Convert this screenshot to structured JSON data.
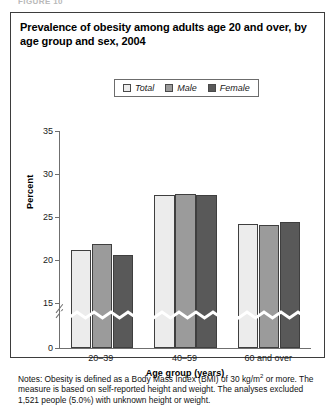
{
  "figure_caption": "FIGURE 10",
  "title": "Prevalence of obesity among adults age 20 and over, by age group and sex, 2004",
  "legend": {
    "items": [
      {
        "label": "Total",
        "color": "#ececec"
      },
      {
        "label": "Male",
        "color": "#9b9b9b"
      },
      {
        "label": "Female",
        "color": "#595959"
      }
    ]
  },
  "notes": {
    "prefix": "Notes: Obesity is defined as a Body Mass Index (BMI) of 30 kg/m",
    "superscript": "2",
    "suffix": " or more. The measure is based on self-reported height and weight. The analyses excluded 1,521 people (5.0%) with unknown height or weight."
  },
  "chart_data": {
    "type": "bar",
    "title": "Prevalence of obesity among adults age 20 and over, by age group and sex, 2004",
    "xlabel": "Age group (years)",
    "ylabel": "Percent",
    "categories": [
      "20–39",
      "40–59",
      "60 and over"
    ],
    "series": [
      {
        "name": "Total",
        "color": "#ececec",
        "values": [
          21.1,
          27.5,
          24.1
        ]
      },
      {
        "name": "Male",
        "color": "#9b9b9b",
        "values": [
          21.7,
          27.6,
          23.9
        ]
      },
      {
        "name": "Female",
        "color": "#595959",
        "values": [
          20.5,
          27.4,
          24.3
        ]
      }
    ],
    "ylim": [
      0,
      35
    ],
    "yticks": [
      0,
      15,
      20,
      25,
      30,
      35
    ],
    "ytick_labels": [
      "0",
      "15",
      "20",
      "25",
      "30",
      "35"
    ],
    "axis_break": {
      "between": [
        0,
        15
      ],
      "style": "zigzag"
    },
    "grid": false,
    "legend_position": "top-center"
  }
}
